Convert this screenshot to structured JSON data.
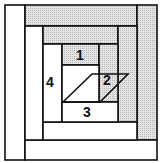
{
  "diagram": {
    "colors": {
      "line": "#111111",
      "shaded": "#dcdcdc",
      "shaded_dot": "#b8b8b8",
      "light": "#ffffff"
    },
    "labels": {
      "piece_1": "1",
      "piece_2": "2",
      "piece_3": "3",
      "piece_4": "4"
    },
    "pieces": [
      {
        "id": "outer-left-strip",
        "fill": "light"
      },
      {
        "id": "outer-top-strip",
        "fill": "shaded"
      },
      {
        "id": "outer-right-strip",
        "fill": "shaded"
      },
      {
        "id": "outer-bottom-strip",
        "fill": "light"
      },
      {
        "id": "middle-left-strip",
        "fill": "light"
      },
      {
        "id": "middle-top-strip",
        "fill": "shaded"
      },
      {
        "id": "middle-right-strip",
        "fill": "shaded"
      },
      {
        "id": "middle-bottom-strip",
        "fill": "light"
      },
      {
        "id": "piece-4",
        "fill": "light"
      },
      {
        "id": "piece-1",
        "fill": "shaded"
      },
      {
        "id": "piece-2",
        "fill": "shaded"
      },
      {
        "id": "piece-3",
        "fill": "light"
      },
      {
        "id": "center-square",
        "fill": "light"
      }
    ]
  }
}
